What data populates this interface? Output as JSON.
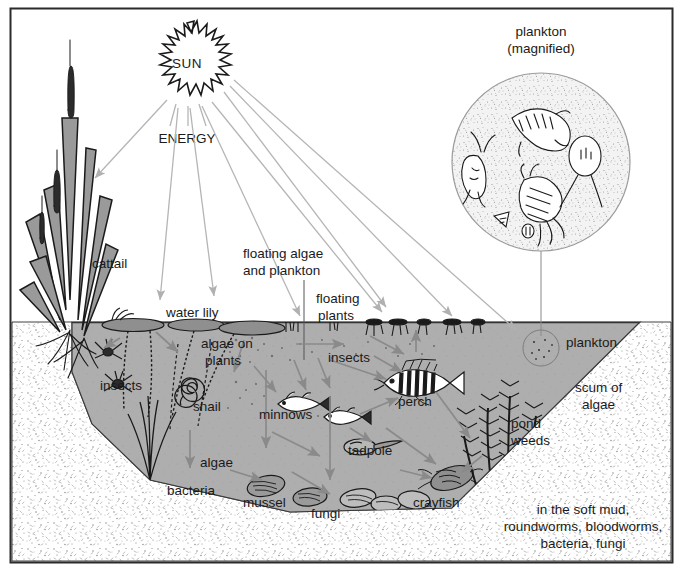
{
  "diagram": {
    "frame": {
      "stroke": "#2b2b2b"
    },
    "palette": {
      "water": "#aeaeae",
      "water_edge": "#2b2b2b",
      "mud": "#fdfdfd",
      "arrow": "#8a8a8a",
      "ray": "#b5b5b5",
      "text": "#1a1a1a",
      "ink": "#1a1a1a",
      "plankton_fill": "#f2f2f2"
    },
    "labels": {
      "sun": "SUN",
      "energy": "ENERGY",
      "plankton_magnified_line1": "plankton",
      "plankton_magnified_line2": "(magnified)",
      "cattail": "cattail",
      "water_lily": "water lily",
      "floating_algae_line1": "floating algae",
      "floating_algae_line2": "and plankton",
      "floating_plants_line1": "floating",
      "floating_plants_line2": "plants",
      "algae_on_plants_line1": "algae on",
      "algae_on_plants_line2": "plants",
      "insects_left": "insects",
      "insects_mid": "insects",
      "snail": "snail",
      "minnows": "minnows",
      "perch": "perch",
      "algae": "algae",
      "bacteria": "bacteria",
      "mussel": "mussel",
      "fungi": "fungi",
      "tadpole": "tadpole",
      "crayfish": "crayfish",
      "pond_weeds_line1": "pond",
      "pond_weeds_line2": "weeds",
      "plankton": "plankton",
      "scum_of_algae_line1": "scum of",
      "scum_of_algae_line2": "algae",
      "soft_mud_line1": "in the soft mud,",
      "soft_mud_line2": "roundworms, bloodworms,",
      "soft_mud_line3": "bacteria, fungi"
    }
  }
}
